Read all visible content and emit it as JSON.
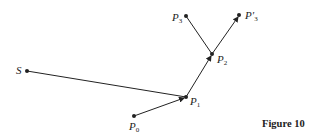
{
  "figure": {
    "caption": "Figure 10",
    "points": [
      {
        "id": "S",
        "label": "S",
        "sub": "",
        "x": 27,
        "y": 71
      },
      {
        "id": "P0",
        "label": "P",
        "sub": "0",
        "x": 134,
        "y": 116
      },
      {
        "id": "P1",
        "label": "P",
        "sub": "1",
        "x": 186,
        "y": 97
      },
      {
        "id": "P2",
        "label": "P",
        "sub": "2",
        "x": 212,
        "y": 54
      },
      {
        "id": "P3",
        "label": "P",
        "sub": "3",
        "x": 186,
        "y": 16
      },
      {
        "id": "P3prime",
        "label": "P′",
        "sub": "3",
        "x": 239,
        "y": 15
      }
    ],
    "edges": [
      {
        "from": "S",
        "to": "P1",
        "arrow": false
      },
      {
        "from": "P0",
        "to": "P1",
        "arrow": true
      },
      {
        "from": "P1",
        "to": "P2",
        "arrow": true
      },
      {
        "from": "P2",
        "to": "P3",
        "arrow": false
      },
      {
        "from": "P2",
        "to": "P3prime",
        "arrow": true
      }
    ],
    "colors": {
      "ink": "#222222",
      "background": "#ffffff"
    }
  }
}
